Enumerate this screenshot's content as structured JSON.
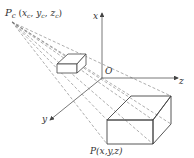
{
  "diagram": {
    "type": "perspective projection",
    "labels": {
      "center_of_projection": "P",
      "center_sub": "c",
      "center_coords": "(x",
      "center_coords_full": "P_c(x_c, y_c, z_c)",
      "object_point": "P(x,y,z)",
      "origin": "O",
      "axis_x": "x",
      "axis_y": "y",
      "axis_z": "z"
    },
    "colors": {
      "line": "#555555",
      "dashed": "#777777",
      "text": "#333333",
      "background": "#ffffff"
    }
  }
}
